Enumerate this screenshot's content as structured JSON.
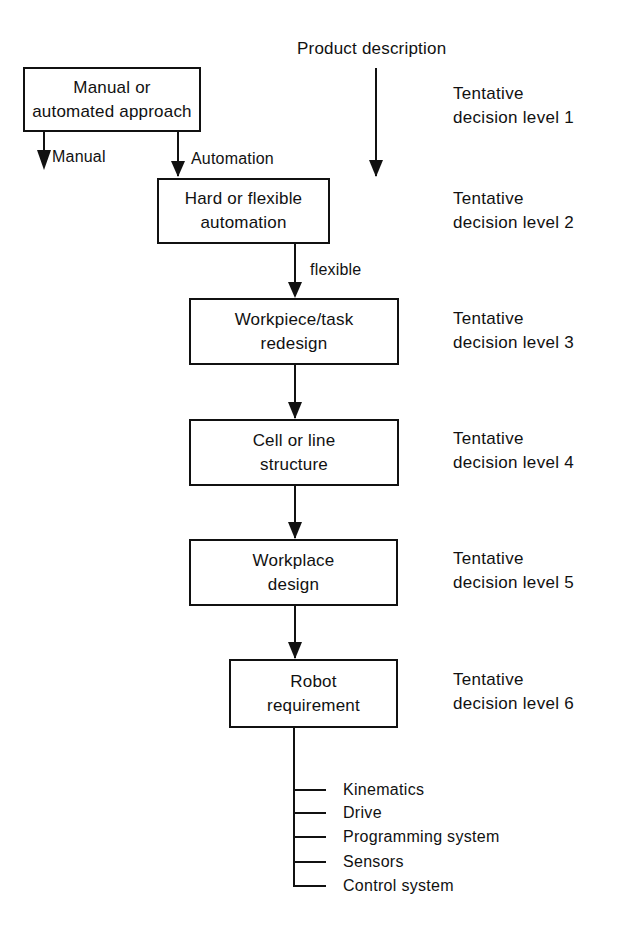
{
  "diagram": {
    "input_label": "Product description",
    "boxes": [
      {
        "line1": "Manual or",
        "line2": "automated approach"
      },
      {
        "line1": "Hard or flexible",
        "line2": "automation"
      },
      {
        "line1": "Workpiece/task",
        "line2": "redesign"
      },
      {
        "line1": "Cell or line",
        "line2": "structure"
      },
      {
        "line1": "Workplace",
        "line2": "design"
      },
      {
        "line1": "Robot",
        "line2": "requirement"
      }
    ],
    "edge_labels": {
      "manual": "Manual",
      "automation": "Automation",
      "flexible": "flexible"
    },
    "levels": [
      {
        "line1": "Tentative",
        "line2": "decision level 1"
      },
      {
        "line1": "Tentative",
        "line2": "decision level 2"
      },
      {
        "line1": "Tentative",
        "line2": "decision level 3"
      },
      {
        "line1": "Tentative",
        "line2": "decision level 4"
      },
      {
        "line1": "Tentative",
        "line2": "decision level 5"
      },
      {
        "line1": "Tentative",
        "line2": "decision level 6"
      }
    ],
    "requirements": [
      "Kinematics",
      "Drive",
      "Programming system",
      "Sensors",
      "Control system"
    ],
    "line_color": "#111111"
  }
}
